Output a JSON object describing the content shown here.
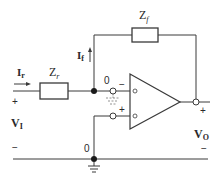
{
  "diagram": {
    "type": "circuit",
    "components": {
      "input_impedance": {
        "label": "Z",
        "sub": "r"
      },
      "feedback_impedance": {
        "label": "Z",
        "sub": "f"
      },
      "opamp": {
        "inverting_sign": "−",
        "noninverting_sign": "+"
      }
    },
    "currents": {
      "input_current": {
        "label": "I",
        "sub": "r"
      },
      "feedback_current": {
        "label": "I",
        "sub": "f"
      }
    },
    "voltages": {
      "input": {
        "label": "V",
        "sub": "I",
        "plus": "+",
        "minus": "−"
      },
      "output": {
        "label": "V",
        "sub": "O",
        "plus": "+",
        "minus": "−"
      }
    },
    "node_labels": {
      "inverting_node": "0",
      "ground_node": "0"
    },
    "virtual_ground_mark": "+"
  },
  "colors": {
    "line": "#3a3a3a",
    "background": "#ffffff"
  }
}
